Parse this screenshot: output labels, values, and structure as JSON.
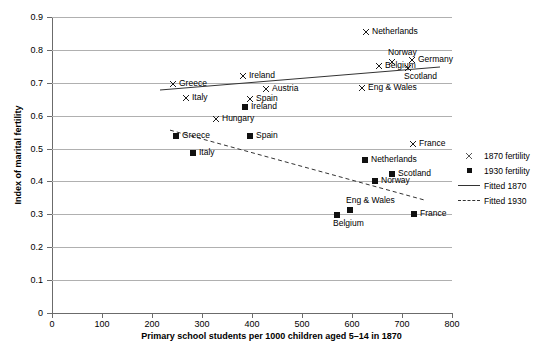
{
  "chart_data": {
    "type": "scatter",
    "title": "",
    "xlabel": "Primary school students per 1000 children aged 5–14 in 1870",
    "ylabel": "Index of marital fertility",
    "xlim": [
      0,
      800
    ],
    "ylim": [
      0,
      0.9
    ],
    "xticks": [
      "0",
      "100",
      "200",
      "300",
      "400",
      "500",
      "600",
      "700",
      "800"
    ],
    "yticks": [
      "0",
      "0.1",
      "0.2",
      "0.3",
      "0.4",
      "0.5",
      "0.6",
      "0.7",
      "0.8",
      "0.9"
    ],
    "grid": "horizontal",
    "legend_position": "right",
    "series": [
      {
        "name": "1870 fertility",
        "marker": "x",
        "points": [
          {
            "label": "Greece",
            "x": 242,
            "y": 0.695,
            "label_pos": "right"
          },
          {
            "label": "Italy",
            "x": 268,
            "y": 0.655,
            "label_pos": "right"
          },
          {
            "label": "Ireland",
            "x": 382,
            "y": 0.72,
            "label_pos": "right"
          },
          {
            "label": "Austria",
            "x": 428,
            "y": 0.681,
            "label_pos": "right"
          },
          {
            "label": "Spain",
            "x": 396,
            "y": 0.652,
            "label_pos": "right"
          },
          {
            "label": "Hungary",
            "x": 328,
            "y": 0.589,
            "label_pos": "right"
          },
          {
            "label": "Netherlands",
            "x": 628,
            "y": 0.855,
            "label_pos": "right"
          },
          {
            "label": "Belgium",
            "x": 654,
            "y": 0.751,
            "label_pos": "right"
          },
          {
            "label": "Norway",
            "x": 680,
            "y": 0.762,
            "label_pos": "above"
          },
          {
            "label": "Germany",
            "x": 720,
            "y": 0.768,
            "label_pos": "right"
          },
          {
            "label": "Scotland",
            "x": 712,
            "y": 0.745,
            "label_pos": "below"
          },
          {
            "label": "Eng & Wales",
            "x": 620,
            "y": 0.684,
            "label_pos": "right"
          },
          {
            "label": "France",
            "x": 722,
            "y": 0.515,
            "label_pos": "right"
          }
        ]
      },
      {
        "name": "1930 fertility",
        "marker": "square",
        "points": [
          {
            "label": "Greece",
            "x": 248,
            "y": 0.537,
            "label_pos": "right"
          },
          {
            "label": "Italy",
            "x": 282,
            "y": 0.485,
            "label_pos": "right"
          },
          {
            "label": "Spain",
            "x": 396,
            "y": 0.537,
            "label_pos": "right"
          },
          {
            "label": "Ireland",
            "x": 386,
            "y": 0.625,
            "label_pos": "right"
          },
          {
            "label": "Netherlands",
            "x": 626,
            "y": 0.465,
            "label_pos": "right"
          },
          {
            "label": "Scotland",
            "x": 680,
            "y": 0.422,
            "label_pos": "right"
          },
          {
            "label": "Norway",
            "x": 646,
            "y": 0.401,
            "label_pos": "right"
          },
          {
            "label": "Eng & Wales",
            "x": 596,
            "y": 0.312,
            "label_pos": "above"
          },
          {
            "label": "Belgium",
            "x": 570,
            "y": 0.297,
            "label_pos": "below"
          },
          {
            "label": "France",
            "x": 724,
            "y": 0.3,
            "label_pos": "right"
          }
        ]
      }
    ],
    "fits": [
      {
        "name": "Fitted 1870",
        "style": "solid",
        "x1": 216,
        "y1": 0.678,
        "x2": 776,
        "y2": 0.748
      },
      {
        "name": "Fitted 1930",
        "style": "dashed",
        "x1": 236,
        "y1": 0.556,
        "x2": 746,
        "y2": 0.343
      }
    ]
  },
  "legend": {
    "items": [
      {
        "key": "x-marker-icon",
        "label": "1870 fertility"
      },
      {
        "key": "square-marker-icon",
        "label": "1930 fertility"
      },
      {
        "key": "solid-line-icon",
        "label": "Fitted 1870"
      },
      {
        "key": "dashed-line-icon",
        "label": "Fitted 1930"
      }
    ]
  }
}
